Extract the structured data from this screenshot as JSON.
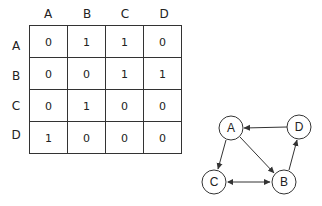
{
  "matrix": {
    "columns": [
      "A",
      "B",
      "C",
      "D"
    ],
    "rows": [
      {
        "label": "A",
        "values": [
          "0",
          "1",
          "1",
          "0"
        ]
      },
      {
        "label": "B",
        "values": [
          "0",
          "0",
          "1",
          "1"
        ]
      },
      {
        "label": "C",
        "values": [
          "0",
          "1",
          "0",
          "0"
        ]
      },
      {
        "label": "D",
        "values": [
          "1",
          "0",
          "0",
          "0"
        ]
      }
    ]
  },
  "graph": {
    "nodes": [
      {
        "id": "A",
        "label": "A",
        "x": 231,
        "y": 128
      },
      {
        "id": "D",
        "label": "D",
        "x": 299,
        "y": 127
      },
      {
        "id": "C",
        "label": "C",
        "x": 214,
        "y": 182
      },
      {
        "id": "B",
        "label": "B",
        "x": 284,
        "y": 182
      }
    ],
    "edges": [
      {
        "from": "A",
        "to": "B"
      },
      {
        "from": "A",
        "to": "C"
      },
      {
        "from": "B",
        "to": "C"
      },
      {
        "from": "B",
        "to": "D"
      },
      {
        "from": "C",
        "to": "B"
      },
      {
        "from": "D",
        "to": "A"
      }
    ]
  }
}
